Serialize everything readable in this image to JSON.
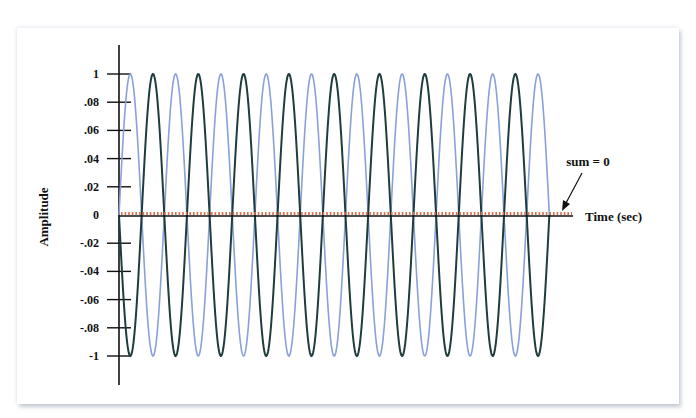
{
  "chart_data": {
    "type": "line",
    "title": "",
    "xlabel": "Time (sec)",
    "ylabel": "Amplitude",
    "ylim": [
      -1,
      1
    ],
    "y_tick_labels": [
      "1",
      ".08",
      ".06",
      ".04",
      ".02",
      "0",
      "-.02",
      "-.04",
      "-.06",
      "-.08",
      "-1"
    ],
    "y_tick_values": [
      1,
      0.8,
      0.6,
      0.4,
      0.2,
      0,
      -0.2,
      -0.4,
      -0.6,
      -0.8,
      -1
    ],
    "grid": false,
    "cycles": 9.5,
    "series": [
      {
        "name": "sine wave",
        "function": "sin(2*pi*f*t)",
        "amplitude": 1,
        "phase_deg": 0,
        "color": "#8aa0d8"
      },
      {
        "name": "inverted sine wave",
        "function": "-sin(2*pi*f*t)",
        "amplitude": 1,
        "phase_deg": 180,
        "color": "#1f3d3d"
      },
      {
        "name": "sum",
        "function": "0",
        "amplitude": 0,
        "color": "#d9704f",
        "style": "dotted"
      }
    ],
    "annotations": [
      {
        "text": "sum = 0",
        "arrow_to": "sum line"
      }
    ]
  },
  "labels": {
    "ylabel": "Amplitude",
    "xlabel": "Time (sec)",
    "annotation": "sum = 0",
    "ticks": [
      "1",
      ".08",
      ".06",
      ".04",
      ".02",
      "0",
      "-.02",
      "-.04",
      "-.06",
      "-.08",
      "-1"
    ]
  },
  "colors": {
    "sine": "#8aa0d8",
    "inverted": "#1f3d3d",
    "sum": "#d9704f",
    "axis": "#111111"
  }
}
